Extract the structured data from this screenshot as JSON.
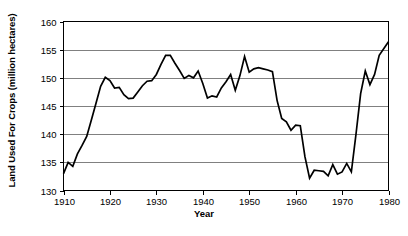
{
  "chart_data": {
    "type": "line",
    "title": "",
    "xlabel": "Year",
    "ylabel": "Land Used For Crops (million hectares)",
    "xlim": [
      1910,
      1980
    ],
    "ylim": [
      130,
      160
    ],
    "xticks": [
      1910,
      1920,
      1930,
      1940,
      1950,
      1960,
      1970,
      1980
    ],
    "yticks": [
      130,
      135,
      140,
      145,
      150,
      155,
      160
    ],
    "grid": "horizontal",
    "legend": "none",
    "line_color": "#000000",
    "gridline_color": "#808080",
    "background_color": "#FFFFFF",
    "series": [
      {
        "name": "Land Used For Crops",
        "x": [
          1910,
          1911,
          1912,
          1913,
          1914,
          1915,
          1916,
          1917,
          1918,
          1919,
          1920,
          1921,
          1922,
          1923,
          1924,
          1925,
          1926,
          1927,
          1928,
          1929,
          1930,
          1931,
          1932,
          1933,
          1934,
          1935,
          1936,
          1937,
          1938,
          1939,
          1940,
          1941,
          1942,
          1943,
          1944,
          1945,
          1946,
          1947,
          1948,
          1949,
          1950,
          1951,
          1952,
          1953,
          1954,
          1955,
          1956,
          1957,
          1958,
          1959,
          1960,
          1961,
          1962,
          1963,
          1964,
          1965,
          1966,
          1967,
          1968,
          1969,
          1970,
          1971,
          1972,
          1973,
          1974,
          1975,
          1976,
          1977,
          1978,
          1979,
          1980
        ],
        "values": [
          133.0,
          135.0,
          134.3,
          136.5,
          138.0,
          139.6,
          142.5,
          145.5,
          148.5,
          150.1,
          149.5,
          148.2,
          148.3,
          147.0,
          146.3,
          146.4,
          147.5,
          148.6,
          149.4,
          149.5,
          150.6,
          152.4,
          154.0,
          154.0,
          152.6,
          151.3,
          149.9,
          150.4,
          150.0,
          151.2,
          149.0,
          146.4,
          146.8,
          146.6,
          148.2,
          149.3,
          150.6,
          147.8,
          150.4,
          153.8,
          151.0,
          151.6,
          151.8,
          151.6,
          151.4,
          151.1,
          146.0,
          142.8,
          142.2,
          140.7,
          141.6,
          141.5,
          136.0,
          132.2,
          133.6,
          133.5,
          133.4,
          132.6,
          134.6,
          132.9,
          133.3,
          134.8,
          133.3,
          140.0,
          147.2,
          151.2,
          148.8,
          150.6,
          154.0,
          155.2,
          156.4
        ]
      }
    ]
  },
  "axis": {
    "y_tick_labels": [
      "160",
      "155",
      "150",
      "145",
      "140",
      "135",
      "130"
    ],
    "x_tick_labels": [
      "1910",
      "1920",
      "1930",
      "1940",
      "1950",
      "1960",
      "1970",
      "1980"
    ],
    "y_title": "Land Used For Crops (million hectares)",
    "x_title": "Year"
  }
}
